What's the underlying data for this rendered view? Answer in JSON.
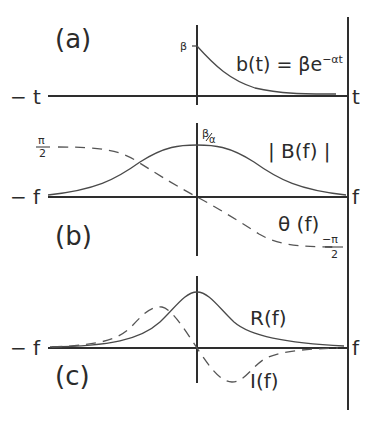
{
  "panels": [
    {
      "id": "a",
      "label": "(a)",
      "axis_left_label": "− t",
      "axis_right_label": "t",
      "y_tick_label": "β",
      "equation": "b(t) = βe",
      "equation_exponent": "−αt",
      "curves": [
        {
          "name": "b(t)",
          "style": "solid",
          "shape": "exponential decay from β at t=0"
        }
      ]
    },
    {
      "id": "b",
      "label": "(b)",
      "axis_left_label": "− f",
      "axis_right_label": "f",
      "peak_label_num": "β",
      "peak_label_den": "α",
      "magnitude_label": "| B(f) |",
      "phase_label": "θ (f)",
      "phase_top_num": "π",
      "phase_top_den": "2",
      "phase_bottom_num": "−π",
      "phase_bottom_den": "2",
      "curves": [
        {
          "name": "|B(f)|",
          "style": "solid",
          "shape": "bell, peak β/α at f=0"
        },
        {
          "name": "θ(f)",
          "style": "dashed",
          "shape": "from π/2 to −π/2 through origin"
        }
      ]
    },
    {
      "id": "c",
      "label": "(c)",
      "axis_left_label": "− f",
      "axis_right_label": "f",
      "real_label": "R(f)",
      "imag_label": "I(f)",
      "curves": [
        {
          "name": "R(f)",
          "style": "solid",
          "shape": "Lorentzian peak at f=0"
        },
        {
          "name": "I(f)",
          "style": "dashed",
          "shape": "odd: positive lobe for f<0, negative lobe for f>0"
        }
      ]
    }
  ],
  "colors": {
    "ink": "#2e2e2e",
    "background": "#ffffff"
  }
}
